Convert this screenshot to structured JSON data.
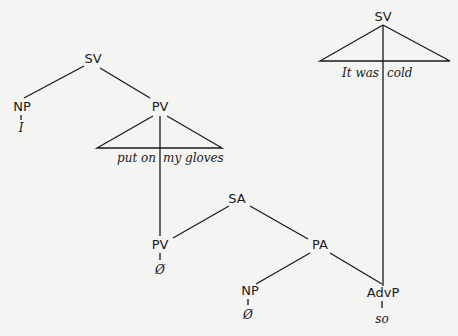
{
  "diagram": {
    "type": "syntax-tree",
    "nodes": {
      "sv_left": "SV",
      "np_subject": "NP",
      "np_subject_word": "I",
      "pv_upper": "PV",
      "pv_upper_words_left": "put on",
      "pv_upper_words_right": "my gloves",
      "sv_right": "SV",
      "sv_right_words_left": "It was",
      "sv_right_words_right": "cold",
      "sa": "SA",
      "pv_lower": "PV",
      "pv_lower_word": "Ø",
      "pa": "PA",
      "np_lower": "NP",
      "np_lower_word": "Ø",
      "advp": "AdvP",
      "advp_word": "so"
    },
    "colors": {
      "ink": "#1a1a1a",
      "paper": "#f4f4f2"
    }
  }
}
